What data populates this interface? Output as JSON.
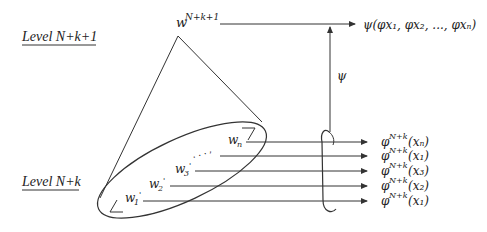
{
  "levels": {
    "upper": "Level N+k+1",
    "lower": "Level N+k"
  },
  "top_node": {
    "base": "w",
    "superscript": "N+k+1"
  },
  "top_output": {
    "label": "ψ(φx₁, φx₂, ..., φxₙ)"
  },
  "mapping_label": "ψ",
  "lower_nodes": [
    {
      "base": "w",
      "sub": "1",
      "prime": "'"
    },
    {
      "base": "w",
      "sub": "2",
      "prime": "'"
    },
    {
      "base": "w",
      "sub": "3",
      "prime": "'"
    },
    {
      "base": "w",
      "sub": "n",
      "prime": ""
    }
  ],
  "ellipsis": ". . . ,",
  "outputs": [
    {
      "phi": "φ",
      "sup": "N+k",
      "arg": "(xₙ)"
    },
    {
      "phi": "φ",
      "sup": "N+k",
      "arg": "(x₁)"
    },
    {
      "phi": "φ",
      "sup": "N+k",
      "arg": "(x₃)"
    },
    {
      "phi": "φ",
      "sup": "N+k",
      "arg": "(x₂)"
    },
    {
      "phi": "φ",
      "sup": "N+k",
      "arg": "(x₁)"
    }
  ],
  "colors": {
    "stroke": "#333333",
    "text": "#222222",
    "background": "#ffffff"
  }
}
